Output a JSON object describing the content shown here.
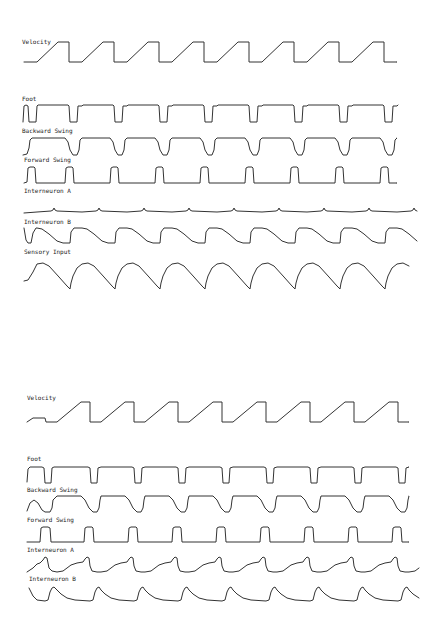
{
  "chart_data": {
    "type": "line",
    "title": "",
    "xlabel": "",
    "ylabel": "",
    "grid": false,
    "legend": "none",
    "panels": [
      {
        "name": "panel-top",
        "traces": [
          {
            "label": "Velocity",
            "label_pos": [
              22,
              44
            ],
            "x_start": 24,
            "x_end": 417,
            "period": 45,
            "cycles": 9,
            "cycle_x0": 37,
            "lead": [
              [
                24,
                62
              ],
              [
                30,
                62
              ],
              [
                37,
                62
              ]
            ],
            "cycle": [
              [
                0,
                62
              ],
              [
                21,
                42
              ],
              [
                32,
                42
              ],
              [
                32,
                62
              ],
              [
                41,
                62
              ],
              [
                45,
                62
              ]
            ],
            "tail_clip": 417
          },
          {
            "label": "Foot",
            "label_pos": [
              22,
              101
            ],
            "x_start": 23,
            "x_end": 417,
            "period": 45,
            "cycles": 9,
            "cycle_x0": 37,
            "lead": [
              [
                23,
                122
              ],
              [
                24,
                106
              ],
              [
                26,
                105
              ],
              [
                28,
                106
              ],
              [
                29,
                122
              ],
              [
                36,
                122
              ]
            ],
            "cycle": [
              [
                0,
                106
              ],
              [
                1,
                105
              ],
              [
                31,
                105
              ],
              [
                32,
                106
              ],
              [
                33,
                122
              ],
              [
                40,
                122
              ],
              [
                41,
                106
              ],
              [
                45,
                106
              ]
            ],
            "tail_clip": 417
          },
          {
            "label": "Backward Swing",
            "label_pos": [
              22,
              133
            ],
            "x_start": 23,
            "x_end": 417,
            "period": 45,
            "cycles": 9,
            "cycle_x0": 37,
            "lead": [
              [
                23,
                155
              ],
              [
                27,
                154
              ],
              [
                29,
                148
              ],
              [
                30,
                140
              ],
              [
                32,
                138
              ],
              [
                37,
                138
              ]
            ],
            "cycle": [
              [
                0,
                138
              ],
              [
                28,
                138
              ],
              [
                31,
                142
              ],
              [
                33,
                150
              ],
              [
                36,
                155
              ],
              [
                40,
                155
              ],
              [
                42,
                150
              ],
              [
                43,
                140
              ],
              [
                45,
                138
              ]
            ],
            "tail_clip": 417
          },
          {
            "label": "Forward Swing",
            "label_pos": [
              24,
              162
            ],
            "x_start": 24,
            "x_end": 417,
            "period": 45,
            "cycles": 9,
            "cycle_x0": 37,
            "lead": [
              [
                24,
                183
              ],
              [
                27,
                182
              ],
              [
                28,
                168
              ],
              [
                30,
                167
              ],
              [
                34,
                167
              ],
              [
                35,
                168
              ],
              [
                36,
                183
              ],
              [
                37,
                183
              ]
            ],
            "cycle": [
              [
                0,
                183
              ],
              [
                28,
                183
              ],
              [
                29,
                168
              ],
              [
                31,
                167
              ],
              [
                35,
                167
              ],
              [
                36,
                168
              ],
              [
                37,
                183
              ],
              [
                45,
                183
              ]
            ],
            "tail_clip": 417
          },
          {
            "label": "Interneuron A",
            "label_pos": [
              24,
              193
            ],
            "x_start": 24,
            "x_end": 417,
            "period": 45,
            "cycles": 9,
            "cycle_x0": 37,
            "lead": [
              [
                24,
                213
              ],
              [
                37,
                212
              ]
            ],
            "cycle": [
              [
                0,
                212
              ],
              [
                14,
                211
              ],
              [
                16,
                210
              ],
              [
                17,
                208
              ],
              [
                18,
                210
              ],
              [
                20,
                211
              ],
              [
                45,
                212
              ]
            ],
            "tail_clip": 417
          },
          {
            "label": "Interneuron B",
            "label_pos": [
              24,
              224
            ],
            "x_start": 24,
            "x_end": 417,
            "period": 45,
            "cycles": 9,
            "cycle_x0": 37,
            "lead": [
              [
                24,
                228
              ],
              [
                26,
                240
              ],
              [
                28,
                243
              ],
              [
                31,
                243
              ],
              [
                33,
                233
              ],
              [
                36,
                228
              ]
            ],
            "cycle": [
              [
                0,
                228
              ],
              [
                5,
                229
              ],
              [
                12,
                234
              ],
              [
                20,
                241
              ],
              [
                26,
                243
              ],
              [
                33,
                243
              ],
              [
                34,
                232
              ],
              [
                37,
                228
              ],
              [
                45,
                228
              ]
            ],
            "tail_clip": 417
          },
          {
            "label": "Sensory Input",
            "label_pos": [
              24,
              254
            ],
            "x_start": 24,
            "x_end": 417,
            "period": 45,
            "cycles": 9,
            "cycle_x0": 37,
            "lead": [
              [
                24,
                281
              ],
              [
                28,
                280
              ],
              [
                33,
                272
              ],
              [
                37,
                264
              ]
            ],
            "cycle": [
              [
                0,
                264
              ],
              [
                6,
                263
              ],
              [
                12,
                266
              ],
              [
                22,
                277
              ],
              [
                30,
                286
              ],
              [
                33,
                289
              ],
              [
                34,
                283
              ],
              [
                36,
                276
              ],
              [
                40,
                268
              ],
              [
                45,
                264
              ]
            ],
            "tail_clip": 417
          }
        ]
      },
      {
        "name": "panel-bottom",
        "traces": [
          {
            "label": "Velocity",
            "label_pos": [
              27,
              400
            ],
            "x_start": 27,
            "x_end": 420,
            "period": 44,
            "cycles": 9,
            "cycle_x0": 57,
            "lead": [
              [
                27,
                422
              ],
              [
                33,
                418
              ],
              [
                45,
                418
              ],
              [
                46,
                422
              ],
              [
                57,
                422
              ]
            ],
            "cycle": [
              [
                0,
                422
              ],
              [
                24,
                402
              ],
              [
                33,
                402
              ],
              [
                33,
                422
              ],
              [
                41,
                422
              ],
              [
                44,
                422
              ]
            ],
            "tail_clip": 420
          },
          {
            "label": "Foot",
            "label_pos": [
              27,
              461
            ],
            "x_start": 27,
            "x_end": 420,
            "period": 44,
            "cycles": 9,
            "cycle_x0": 57,
            "lead": [
              [
                27,
                482
              ],
              [
                28,
                469
              ],
              [
                30,
                467
              ],
              [
                42,
                467
              ],
              [
                44,
                468
              ],
              [
                45,
                483
              ],
              [
                51,
                483
              ],
              [
                52,
                468
              ],
              [
                54,
                467
              ],
              [
                57,
                467
              ]
            ],
            "cycle": [
              [
                0,
                467
              ],
              [
                31,
                467
              ],
              [
                33,
                468
              ],
              [
                34,
                483
              ],
              [
                40,
                483
              ],
              [
                41,
                468
              ],
              [
                44,
                467
              ]
            ],
            "tail_clip": 420
          },
          {
            "label": "Backward Swing",
            "label_pos": [
              27,
              492
            ],
            "x_start": 27,
            "x_end": 420,
            "period": 44,
            "cycles": 9,
            "cycle_x0": 57,
            "lead": [
              [
                27,
                511
              ],
              [
                30,
                503
              ],
              [
                34,
                500
              ],
              [
                38,
                503
              ],
              [
                42,
                510
              ],
              [
                45,
                512
              ],
              [
                50,
                512
              ],
              [
                52,
                508
              ],
              [
                53,
                500
              ],
              [
                57,
                496
              ]
            ],
            "cycle": [
              [
                0,
                496
              ],
              [
                24,
                496
              ],
              [
                28,
                500
              ],
              [
                32,
                508
              ],
              [
                36,
                512
              ],
              [
                40,
                512
              ],
              [
                42,
                508
              ],
              [
                43,
                500
              ],
              [
                44,
                496
              ]
            ],
            "tail_clip": 420
          },
          {
            "label": "Forward Swing",
            "label_pos": [
              27,
              522
            ],
            "x_start": 27,
            "x_end": 420,
            "period": 44,
            "cycles": 9,
            "cycle_x0": 57,
            "lead": [
              [
                27,
                542
              ],
              [
                40,
                542
              ],
              [
                41,
                528
              ],
              [
                43,
                527
              ],
              [
                48,
                527
              ],
              [
                50,
                528
              ],
              [
                51,
                542
              ],
              [
                57,
                542
              ]
            ],
            "cycle": [
              [
                0,
                542
              ],
              [
                27,
                542
              ],
              [
                28,
                528
              ],
              [
                30,
                527
              ],
              [
                35,
                527
              ],
              [
                36,
                528
              ],
              [
                37,
                542
              ],
              [
                44,
                542
              ]
            ],
            "tail_clip": 420
          },
          {
            "label": "Interneuron A",
            "label_pos": [
              27,
              552
            ],
            "x_start": 27,
            "x_end": 420,
            "period": 44,
            "cycles": 9,
            "cycle_x0": 57,
            "lead": [
              [
                27,
                572
              ],
              [
                33,
                568
              ],
              [
                37,
                564
              ],
              [
                40,
                563
              ],
              [
                43,
                560
              ],
              [
                45,
                557
              ],
              [
                47,
                558
              ],
              [
                49,
                568
              ],
              [
                52,
                571
              ],
              [
                57,
                572
              ]
            ],
            "cycle": [
              [
                0,
                572
              ],
              [
                6,
                571
              ],
              [
                10,
                568
              ],
              [
                14,
                565
              ],
              [
                20,
                563
              ],
              [
                26,
                562
              ],
              [
                28,
                559
              ],
              [
                30,
                557
              ],
              [
                32,
                558
              ],
              [
                33,
                566
              ],
              [
                35,
                571
              ],
              [
                40,
                572
              ],
              [
                44,
                572
              ]
            ],
            "tail_clip": 420
          },
          {
            "label": "Interneuron B",
            "label_pos": [
              29,
              581
            ],
            "x_start": 29,
            "x_end": 420,
            "period": 44,
            "cycles": 9,
            "cycle_x0": 57,
            "lead": [
              [
                29,
                588
              ],
              [
                33,
                596
              ],
              [
                37,
                600
              ],
              [
                45,
                601
              ],
              [
                48,
                600
              ],
              [
                50,
                592
              ],
              [
                52,
                588
              ],
              [
                54,
                587
              ],
              [
                57,
                590
              ]
            ],
            "cycle": [
              [
                0,
                590
              ],
              [
                4,
                594
              ],
              [
                10,
                598
              ],
              [
                18,
                600
              ],
              [
                33,
                601
              ],
              [
                36,
                600
              ],
              [
                38,
                592
              ],
              [
                40,
                588
              ],
              [
                42,
                587
              ],
              [
                44,
                590
              ]
            ],
            "tail_clip": 420
          }
        ]
      }
    ]
  }
}
